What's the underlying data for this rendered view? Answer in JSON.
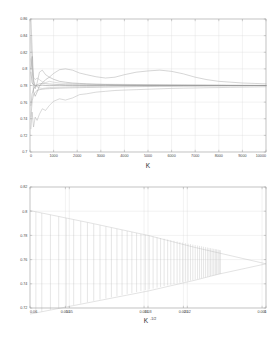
{
  "figure": {
    "background_color": "#ffffff",
    "frame_color": "#9a9a9a",
    "grid_color": "#d8d8d8"
  },
  "chart_data": [
    {
      "id": "convergence-top",
      "type": "line",
      "title": "",
      "xlabel": "K",
      "ylabel": "",
      "xlim": [
        0,
        10000
      ],
      "ylim": [
        0.7,
        0.86
      ],
      "grid": true,
      "legend": "none",
      "xticks": [
        0,
        1000,
        2000,
        3000,
        4000,
        5000,
        6000,
        7000,
        8000,
        9000,
        10000
      ],
      "xticklabels": [
        "0",
        "1000",
        "2000",
        "3000",
        "4000",
        "5000",
        "6000",
        "7000",
        "8000",
        "9000",
        "10000"
      ],
      "yticks": [
        0.7,
        0.72,
        0.74,
        0.76,
        0.78,
        0.8,
        0.82,
        0.84,
        0.86
      ],
      "yticklabels": [
        "0.7",
        "0.72",
        "0.74",
        "0.76",
        "0.78",
        "0.8",
        "0.82",
        "0.84",
        "0.86"
      ],
      "converged_value": 0.78,
      "x": [
        40,
        90,
        150,
        220,
        300,
        400,
        520,
        660,
        820,
        1000,
        1250,
        1500,
        1800,
        2100,
        2400,
        2800,
        3200,
        3600,
        4000,
        4500,
        5000,
        5500,
        6000,
        6500,
        7000,
        7500,
        8000,
        8500,
        9000,
        9500,
        10000
      ],
      "series": [
        {
          "name": "run-1",
          "color": "#9c9c9c",
          "values": [
            0.8595,
            0.825,
            0.788,
            0.776,
            0.783,
            0.796,
            0.7985,
            0.793,
            0.79,
            0.7945,
            0.799,
            0.8,
            0.7985,
            0.795,
            0.793,
            0.7905,
            0.789,
            0.79,
            0.793,
            0.796,
            0.7975,
            0.7985,
            0.797,
            0.794,
            0.79,
            0.787,
            0.785,
            0.784,
            0.783,
            0.7825,
            0.782
          ]
        },
        {
          "name": "run-2",
          "color": "#8a8a8a",
          "values": [
            0.8,
            0.815,
            0.772,
            0.767,
            0.772,
            0.7795,
            0.783,
            0.787,
            0.79,
            0.7875,
            0.785,
            0.784,
            0.783,
            0.7825,
            0.782,
            0.7815,
            0.7812,
            0.781,
            0.7808,
            0.7806,
            0.7805,
            0.7804,
            0.7803,
            0.7802,
            0.7802,
            0.7801,
            0.7801,
            0.78,
            0.78,
            0.78,
            0.78
          ]
        },
        {
          "name": "run-3",
          "color": "#a5a5a5",
          "values": [
            0.728,
            0.748,
            0.73,
            0.742,
            0.738,
            0.7455,
            0.752,
            0.75,
            0.756,
            0.761,
            0.764,
            0.7625,
            0.765,
            0.769,
            0.77,
            0.772,
            0.773,
            0.774,
            0.7745,
            0.775,
            0.7755,
            0.776,
            0.7765,
            0.7768,
            0.777,
            0.7773,
            0.7775,
            0.7778,
            0.778,
            0.7782,
            0.7785
          ]
        },
        {
          "name": "run-4",
          "color": "#7d7d7d",
          "values": [
            0.796,
            0.783,
            0.781,
            0.78,
            0.7795,
            0.78,
            0.7805,
            0.78,
            0.7798,
            0.78,
            0.7802,
            0.78,
            0.7799,
            0.78,
            0.78,
            0.78,
            0.7801,
            0.78,
            0.78,
            0.78,
            0.78,
            0.78,
            0.78,
            0.78,
            0.78,
            0.78,
            0.78,
            0.78,
            0.78,
            0.78,
            0.78
          ]
        },
        {
          "name": "run-5",
          "color": "#b0b0b0",
          "values": [
            0.838,
            0.805,
            0.79,
            0.787,
            0.789,
            0.787,
            0.7845,
            0.7835,
            0.785,
            0.784,
            0.783,
            0.7825,
            0.7822,
            0.782,
            0.7818,
            0.7816,
            0.7815,
            0.7814,
            0.7813,
            0.7812,
            0.7811,
            0.781,
            0.781,
            0.7809,
            0.7808,
            0.7807,
            0.7806,
            0.7805,
            0.7804,
            0.7803,
            0.7802
          ]
        },
        {
          "name": "run-6",
          "color": "#949494",
          "values": [
            0.742,
            0.761,
            0.769,
            0.772,
            0.774,
            0.775,
            0.7755,
            0.776,
            0.7762,
            0.7765,
            0.7768,
            0.777,
            0.7772,
            0.7774,
            0.7776,
            0.7778,
            0.778,
            0.7782,
            0.7784,
            0.7786,
            0.7788,
            0.779,
            0.7791,
            0.7792,
            0.7793,
            0.7794,
            0.7795,
            0.7796,
            0.7797,
            0.7798,
            0.7798
          ]
        },
        {
          "name": "run-7",
          "color": "#adadad",
          "values": [
            0.812,
            0.796,
            0.785,
            0.781,
            0.7785,
            0.777,
            0.7765,
            0.777,
            0.7775,
            0.7778,
            0.778,
            0.7782,
            0.7784,
            0.7786,
            0.7788,
            0.779,
            0.7791,
            0.7792,
            0.7793,
            0.7794,
            0.7795,
            0.7796,
            0.7796,
            0.7797,
            0.7797,
            0.7798,
            0.7798,
            0.7799,
            0.7799,
            0.78,
            0.78
          ]
        },
        {
          "name": "run-8",
          "color": "#8f8f8f",
          "values": [
            0.756,
            0.77,
            0.776,
            0.779,
            0.781,
            0.782,
            0.7825,
            0.7822,
            0.7818,
            0.7815,
            0.7812,
            0.781,
            0.7809,
            0.7808,
            0.7807,
            0.7806,
            0.7805,
            0.7805,
            0.7804,
            0.7804,
            0.7803,
            0.7803,
            0.7802,
            0.7802,
            0.7801,
            0.7801,
            0.7801,
            0.78,
            0.78,
            0.78,
            0.78
          ]
        }
      ]
    },
    {
      "id": "funnel-bottom",
      "type": "line",
      "title": "",
      "xlabel": "K^-1/2",
      "xlabel_base": "K",
      "xlabel_exponent": "-1/2",
      "ylabel": "",
      "xlim": [
        0.06,
        0.0
      ],
      "ylim": [
        0.72,
        0.82
      ],
      "grid": true,
      "legend": "none",
      "x_axis_reversed": true,
      "xticks": [
        0.06,
        0.051,
        0.05,
        0.031,
        0.03,
        0.021,
        0.02,
        0.001,
        0.0
      ],
      "xticklabels": [
        "0.06",
        "0.051",
        "0.05",
        "0.031",
        "0.03",
        "0.021",
        "0.02",
        "0.001",
        "0"
      ],
      "yticks": [
        0.72,
        0.74,
        0.76,
        0.78,
        0.8,
        0.82
      ],
      "yticklabels": [
        "0.72",
        "0.74",
        "0.76",
        "0.78",
        "0.8",
        "0.82"
      ],
      "center_value": 0.7565,
      "envelope_upper": [
        {
          "x": 0.06,
          "y": 0.8005
        },
        {
          "x": 0.045,
          "y": 0.7905
        },
        {
          "x": 0.03,
          "y": 0.78
        },
        {
          "x": 0.018,
          "y": 0.77
        },
        {
          "x": 0.012,
          "y": 0.7655
        },
        {
          "x": 0.0,
          "y": 0.7565
        }
      ],
      "envelope_lower": [
        {
          "x": 0.06,
          "y": 0.715
        },
        {
          "x": 0.045,
          "y": 0.7245
        },
        {
          "x": 0.03,
          "y": 0.734
        },
        {
          "x": 0.018,
          "y": 0.743
        },
        {
          "x": 0.012,
          "y": 0.748
        },
        {
          "x": 0.0,
          "y": 0.7565
        }
      ],
      "errorbar_color": "#b5b5b5",
      "errorbars": [
        {
          "x": 0.0585,
          "lo": 0.716,
          "hi": 0.7995
        },
        {
          "x": 0.057,
          "lo": 0.717,
          "hi": 0.7985
        },
        {
          "x": 0.0548,
          "lo": 0.7185,
          "hi": 0.797
        },
        {
          "x": 0.0527,
          "lo": 0.7199,
          "hi": 0.7955
        },
        {
          "x": 0.0508,
          "lo": 0.7212,
          "hi": 0.7942
        },
        {
          "x": 0.0489,
          "lo": 0.7225,
          "hi": 0.7929
        },
        {
          "x": 0.0471,
          "lo": 0.7237,
          "hi": 0.7917
        },
        {
          "x": 0.0454,
          "lo": 0.7248,
          "hi": 0.7905
        },
        {
          "x": 0.0438,
          "lo": 0.7259,
          "hi": 0.7894
        },
        {
          "x": 0.0422,
          "lo": 0.7269,
          "hi": 0.7883
        },
        {
          "x": 0.0407,
          "lo": 0.7279,
          "hi": 0.7873
        },
        {
          "x": 0.0393,
          "lo": 0.7289,
          "hi": 0.7863
        },
        {
          "x": 0.0379,
          "lo": 0.7298,
          "hi": 0.7854
        },
        {
          "x": 0.0366,
          "lo": 0.7307,
          "hi": 0.7845
        },
        {
          "x": 0.0353,
          "lo": 0.7316,
          "hi": 0.7836
        },
        {
          "x": 0.0341,
          "lo": 0.7324,
          "hi": 0.7828
        },
        {
          "x": 0.0329,
          "lo": 0.7332,
          "hi": 0.782
        },
        {
          "x": 0.0318,
          "lo": 0.734,
          "hi": 0.7812
        },
        {
          "x": 0.0307,
          "lo": 0.7347,
          "hi": 0.7805
        },
        {
          "x": 0.0297,
          "lo": 0.7354,
          "hi": 0.7798
        },
        {
          "x": 0.0287,
          "lo": 0.7361,
          "hi": 0.7791
        },
        {
          "x": 0.0277,
          "lo": 0.7368,
          "hi": 0.7784
        },
        {
          "x": 0.0268,
          "lo": 0.7374,
          "hi": 0.7778
        },
        {
          "x": 0.0259,
          "lo": 0.7381,
          "hi": 0.7772
        },
        {
          "x": 0.025,
          "lo": 0.7387,
          "hi": 0.7766
        },
        {
          "x": 0.0242,
          "lo": 0.7392,
          "hi": 0.7761
        },
        {
          "x": 0.0234,
          "lo": 0.7398,
          "hi": 0.7755
        },
        {
          "x": 0.0226,
          "lo": 0.7403,
          "hi": 0.775
        },
        {
          "x": 0.0219,
          "lo": 0.7408,
          "hi": 0.7745
        },
        {
          "x": 0.0212,
          "lo": 0.7413,
          "hi": 0.7741
        },
        {
          "x": 0.0205,
          "lo": 0.7418,
          "hi": 0.7736
        },
        {
          "x": 0.0198,
          "lo": 0.7423,
          "hi": 0.7732
        },
        {
          "x": 0.0192,
          "lo": 0.7427,
          "hi": 0.7728
        },
        {
          "x": 0.0186,
          "lo": 0.7431,
          "hi": 0.7724
        },
        {
          "x": 0.018,
          "lo": 0.7436,
          "hi": 0.772
        },
        {
          "x": 0.0174,
          "lo": 0.744,
          "hi": 0.7716
        },
        {
          "x": 0.0169,
          "lo": 0.7443,
          "hi": 0.7713
        },
        {
          "x": 0.0164,
          "lo": 0.7447,
          "hi": 0.771
        },
        {
          "x": 0.0159,
          "lo": 0.7451,
          "hi": 0.7706
        },
        {
          "x": 0.0154,
          "lo": 0.7454,
          "hi": 0.7703
        },
        {
          "x": 0.0149,
          "lo": 0.7458,
          "hi": 0.77
        },
        {
          "x": 0.0145,
          "lo": 0.7461,
          "hi": 0.7697
        },
        {
          "x": 0.0141,
          "lo": 0.7464,
          "hi": 0.7695
        },
        {
          "x": 0.0137,
          "lo": 0.7467,
          "hi": 0.7692
        },
        {
          "x": 0.0133,
          "lo": 0.747,
          "hi": 0.7689
        },
        {
          "x": 0.0129,
          "lo": 0.7472,
          "hi": 0.7687
        },
        {
          "x": 0.0126,
          "lo": 0.7475,
          "hi": 0.7685
        },
        {
          "x": 0.0122,
          "lo": 0.7477,
          "hi": 0.7683
        },
        {
          "x": 0.0119,
          "lo": 0.748,
          "hi": 0.768
        },
        {
          "x": 0.0116,
          "lo": 0.7482,
          "hi": 0.7678
        }
      ]
    }
  ]
}
